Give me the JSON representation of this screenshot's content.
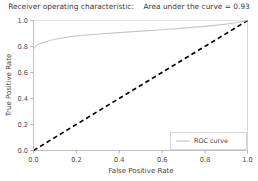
{
  "chart_data": {
    "type": "line",
    "title": "Receiver operating characteristic:    Area under the curve = 0.93",
    "title_main": "Receiver operating characteristic:",
    "title_auc": "Area under the curve = 0.93",
    "auc": 0.93,
    "xlabel": "False Positive Rate",
    "ylabel": "True Positive Rate",
    "xlim": [
      0.0,
      1.0
    ],
    "ylim": [
      0.0,
      1.0
    ],
    "xticks": [
      "0.0",
      "0.2",
      "0.4",
      "0.6",
      "0.8",
      "1.0"
    ],
    "yticks": [
      "0.0",
      "0.2",
      "0.4",
      "0.6",
      "0.8",
      "1.0"
    ],
    "xtick_values": [
      0.0,
      0.2,
      0.4,
      0.6,
      0.8,
      1.0
    ],
    "ytick_values": [
      0.0,
      0.2,
      0.4,
      0.6,
      0.8,
      1.0
    ],
    "grid": false,
    "legend_position": "lower right",
    "series": [
      {
        "name": "ROC curve",
        "style": "solid",
        "color": "#c8c8c8",
        "x": [
          0.0,
          0.0,
          0.01,
          0.02,
          0.03,
          0.05,
          0.08,
          0.12,
          0.18,
          0.25,
          0.32,
          0.4,
          0.5,
          0.6,
          0.7,
          0.8,
          0.9,
          0.95,
          1.0
        ],
        "y": [
          0.0,
          0.78,
          0.805,
          0.815,
          0.822,
          0.833,
          0.848,
          0.862,
          0.878,
          0.888,
          0.898,
          0.907,
          0.918,
          0.929,
          0.941,
          0.955,
          0.972,
          0.984,
          1.0
        ]
      },
      {
        "name": "chance",
        "style": "dashed",
        "color": "#000000",
        "in_legend": false,
        "x": [
          0.0,
          1.0
        ],
        "y": [
          0.0,
          1.0
        ]
      }
    ],
    "legend_entries": [
      {
        "label": "ROC curve",
        "color": "#c8c8c8",
        "style": "solid"
      }
    ]
  },
  "colors": {
    "roc_line": "#c8c8c8",
    "chance_line": "#000000",
    "axis": "#bfbfbf",
    "text": "#3f3f3f",
    "background": "#ffffff"
  }
}
